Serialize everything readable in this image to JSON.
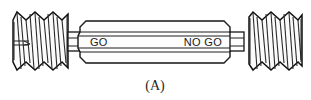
{
  "figure": {
    "caption": "(A)",
    "background_color": "#ffffff",
    "line_color": "#141414",
    "fill_color": "#fdfdfd",
    "text_color": "#1a1a1a"
  },
  "gauge": {
    "go_label": "GO",
    "no_go_label": "NO GO",
    "left_end": {
      "name": "go-threaded-end",
      "thread_count": 6
    },
    "right_end": {
      "name": "no-go-threaded-end",
      "thread_count": 5
    },
    "handle": {
      "name": "hex-handle-body"
    }
  }
}
